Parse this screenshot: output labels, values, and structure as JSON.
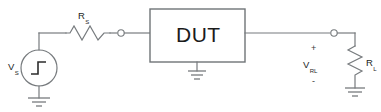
{
  "diagram": {
    "components": {
      "source": {
        "label_main": "V",
        "label_sub": "S",
        "symbol": "step-source",
        "type": "step voltage source"
      },
      "series_resistor": {
        "label_main": "R",
        "label_sub": "S",
        "symbol": "resistor-zigzag",
        "type": "resistor"
      },
      "dut": {
        "label": "DUT",
        "type": "device-under-test block"
      },
      "load_resistor": {
        "label_main": "R",
        "label_sub": "L",
        "symbol": "resistor-zigzag",
        "type": "resistor"
      },
      "load_voltage": {
        "label_main": "V",
        "label_sub": "RL",
        "plus": "+",
        "minus": "-",
        "type": "voltage annotation"
      }
    },
    "colors": {
      "wire": "#777b7e",
      "outline": "#6f7477",
      "text": "#1d1d1d",
      "background": "#ffffff"
    }
  }
}
